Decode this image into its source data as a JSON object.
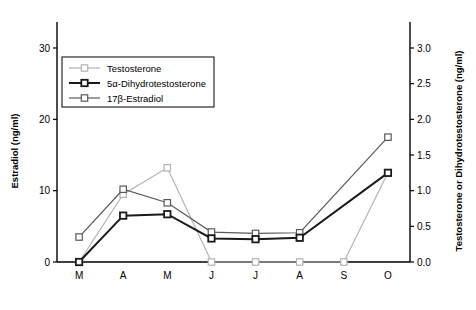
{
  "chart_data": {
    "type": "line",
    "title": "",
    "x": [
      "M",
      "A",
      "M",
      "J",
      "J",
      "A",
      "S",
      "O"
    ],
    "xlabel": "",
    "ylabel": "Estradiol (ng/ml)",
    "y2label": "Testosterone or Dihydrotestosterone (ng/ml)",
    "ylim": [
      0,
      30
    ],
    "y2lim": [
      0.0,
      3.0
    ],
    "yticks": [
      "0",
      "10",
      "20",
      "30"
    ],
    "ytick_values": [
      0,
      10,
      20,
      30
    ],
    "y2ticks": [
      "0.0",
      "0.5",
      "1.0",
      "1.5",
      "2.0",
      "2.5",
      "3.0"
    ],
    "y2tick_values": [
      0.0,
      0.5,
      1.0,
      1.5,
      2.0,
      2.5,
      3.0
    ],
    "grid": false,
    "legend_position": "upper-left",
    "series": [
      {
        "name": "Testosterone",
        "axis": "right",
        "color": "#b3b3b3",
        "marker": "open-square",
        "line_width": 1.2,
        "values": [
          0.0,
          0.95,
          1.32,
          0.0,
          0.0,
          0.0,
          0.0,
          1.25
        ]
      },
      {
        "name": "5α-Dihydrotestosterone",
        "axis": "right",
        "color": "#1a1a1a",
        "marker": "open-square",
        "line_width": 2.0,
        "values": [
          0.0,
          0.65,
          0.67,
          0.33,
          0.32,
          0.34,
          null,
          1.25
        ]
      },
      {
        "name": "17β-Estradiol",
        "axis": "left",
        "color": "#595959",
        "marker": "open-square",
        "line_width": 1.2,
        "values": [
          3.5,
          10.2,
          8.3,
          4.2,
          4.0,
          4.1,
          null,
          17.5
        ]
      }
    ]
  },
  "legend": {
    "entries": [
      {
        "label": "Testosterone"
      },
      {
        "label": "5α-Dihydrotestosterone"
      },
      {
        "label": "17β-Estradiol"
      }
    ]
  },
  "colors": {
    "testosterone": "#b3b3b3",
    "dihydrotestosterone": "#1a1a1a",
    "estradiol": "#595959",
    "axis": "#000000",
    "background": "#ffffff"
  }
}
